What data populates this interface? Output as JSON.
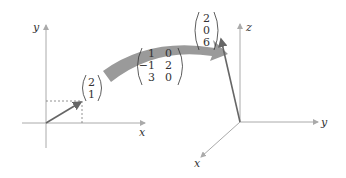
{
  "left_axes": {
    "x_label": "x",
    "y_label": "y",
    "vector": [
      "2",
      "1"
    ]
  },
  "matrix": {
    "rows": [
      [
        "1",
        "0"
      ],
      [
        "−1",
        "2"
      ],
      [
        "3",
        "0"
      ]
    ]
  },
  "right_axes": {
    "x_label": "x",
    "y_label": "y",
    "z_label": "z",
    "vector": [
      "2",
      "0",
      "6"
    ]
  },
  "colors": {
    "axis": "#aaaaaa",
    "vector": "#666666",
    "arrow": "#9a9a9a",
    "text": "#333333"
  }
}
